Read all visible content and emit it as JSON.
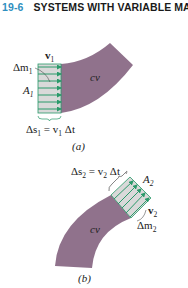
{
  "header": {
    "section_number": "19-6",
    "section_title": "SYSTEMS WITH VARIABLE MASS"
  },
  "figure_a": {
    "caption": "(a)",
    "region_label": "cv",
    "velocity_label": "v",
    "velocity_sub": "1",
    "mass_label": "Δm",
    "mass_sub": "1",
    "area_label": "A",
    "area_sub": "1",
    "displacement_label": "Δs",
    "displacement_sub": "1",
    "displacement_eq": " = v",
    "displacement_eq_sub": "1",
    "displacement_eq_tail": " Δt"
  },
  "figure_b": {
    "caption": "(b)",
    "region_label": "cv",
    "velocity_label": "v",
    "velocity_sub": "2",
    "mass_label": "Δm",
    "mass_sub": "2",
    "area_label": "A",
    "area_sub": "2",
    "displacement_label": "Δs",
    "displacement_sub": "2",
    "displacement_eq": " = v",
    "displacement_eq_sub": "2",
    "displacement_eq_tail": " Δt"
  },
  "colors": {
    "section_number": "#2f8fc0",
    "control_volume_fill": "#8a6a86",
    "arrow_green": "#2a9a6a",
    "slab_fill": "#d9d9d9"
  }
}
